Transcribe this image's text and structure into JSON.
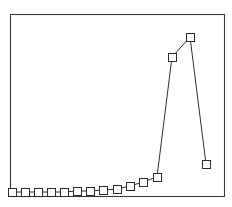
{
  "chart_data": {
    "type": "line",
    "title": "",
    "subtitle": "",
    "xlabel": "",
    "ylabel": "",
    "grid": false,
    "legend": null,
    "marker": "square-open",
    "line_color": "#2e2e2e",
    "marker_fill": "#ffffff",
    "marker_edge_color": "#2b2b2b",
    "frame_color": "#3a3a3a",
    "background_color": "#ffffff",
    "xlim": [
      0,
      16
    ],
    "ylim": [
      0,
      1
    ],
    "x": [
      0,
      1,
      2,
      3,
      4,
      5,
      6,
      7,
      8,
      9,
      10,
      11,
      12,
      13,
      14,
      15
    ],
    "values": [
      0.005,
      0.005,
      0.005,
      0.005,
      0.006,
      0.007,
      0.009,
      0.012,
      0.02,
      0.035,
      0.055,
      0.1,
      0.78,
      0.9,
      0.17,
      0.0
    ],
    "series": [
      {
        "name": "series-1",
        "values": [
          0.005,
          0.005,
          0.005,
          0.005,
          0.006,
          0.007,
          0.009,
          0.012,
          0.02,
          0.035,
          0.055,
          0.1,
          0.78,
          0.9,
          0.17,
          0.0
        ]
      }
    ],
    "points_px": [
      [
        12,
        192
      ],
      [
        25,
        192
      ],
      [
        38,
        192
      ],
      [
        51,
        192
      ],
      [
        64,
        192
      ],
      [
        77,
        191
      ],
      [
        90,
        191
      ],
      [
        103,
        190
      ],
      [
        117,
        189
      ],
      [
        130,
        186
      ],
      [
        143,
        182
      ],
      [
        157,
        177
      ],
      [
        172,
        57
      ],
      [
        190,
        37
      ],
      [
        206,
        164
      ]
    ],
    "frame_px": {
      "left": 10,
      "top": 14,
      "right": 224,
      "bottom": 196
    },
    "marker_size_px": 8,
    "annotations": []
  }
}
